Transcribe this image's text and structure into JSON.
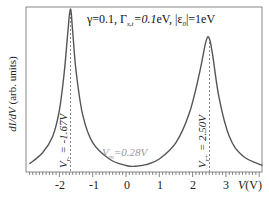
{
  "chart_data": {
    "type": "line",
    "title": "",
    "annotation_params": "γ=0.1, Γs,t=0.1eV, |ε0|=1eV",
    "xlabel": "V(V)",
    "ylabel": "dI/dV (arb. units)",
    "xlim": [
      -2.9,
      4.1
    ],
    "ylim": [
      0,
      1
    ],
    "xticks": [
      -2,
      -1,
      0,
      1,
      2,
      3
    ],
    "grid": false,
    "legend": null,
    "series": [
      {
        "name": "dI/dV",
        "x": [
          -2.9,
          -2.5,
          -2.2,
          -2.0,
          -1.85,
          -1.75,
          -1.67,
          -1.6,
          -1.5,
          -1.3,
          -1.0,
          -0.5,
          0.0,
          0.28,
          0.6,
          1.0,
          1.5,
          1.9,
          2.2,
          2.4,
          2.5,
          2.6,
          2.8,
          3.1,
          3.5,
          4.1
        ],
        "values": [
          0.05,
          0.12,
          0.22,
          0.38,
          0.62,
          0.85,
          1.0,
          0.86,
          0.62,
          0.35,
          0.18,
          0.08,
          0.04,
          0.035,
          0.045,
          0.08,
          0.18,
          0.36,
          0.6,
          0.8,
          0.82,
          0.72,
          0.45,
          0.22,
          0.1,
          0.04
        ]
      }
    ],
    "annotations": [
      {
        "text": "V_r = -1.67V",
        "x": -1.67,
        "style": "dashed vertical line"
      },
      {
        "text": "V_r+ = 2.50V",
        "x": 2.5,
        "style": "dashed vertical line"
      },
      {
        "text": "V_m = 0.28V",
        "x": 0.28
      }
    ]
  },
  "labels": {
    "ylabel_main": "dI/dV",
    "ylabel_unit": " (arb. units)",
    "param_gamma": "γ=0.1, Γ",
    "param_gamma_sub": "s,t",
    "param_gamma_val": "=0.1",
    "param_ev": "eV, |ε",
    "param_eps_sub": "0",
    "param_eps_val": "|=1eV",
    "xaxis_var": "V",
    "xaxis_unit": "(V)",
    "vr_minus_main": "V",
    "vr_minus_sub": "r-",
    "vr_minus_val": " = -1.67V",
    "vr_plus_main": "V",
    "vr_plus_sub": "r+",
    "vr_plus_val": " = 2.50V",
    "vm_main": "V",
    "vm_sub": "m",
    "vm_val": "=0.28V",
    "xticks": [
      "-2",
      "-1",
      "0",
      "1",
      "2",
      "3"
    ]
  },
  "colors": {
    "curve": "#555555",
    "frame": "#777777",
    "dashed": "#888888",
    "vm_text": "#999999"
  }
}
